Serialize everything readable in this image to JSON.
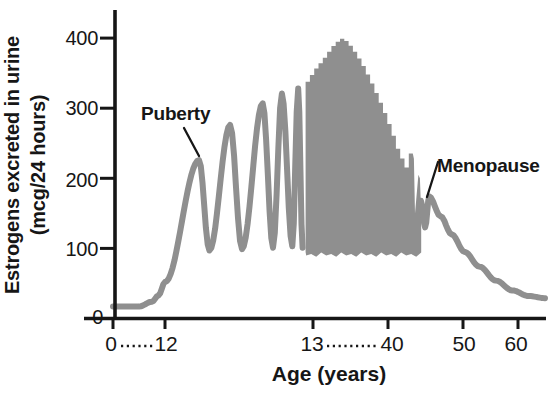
{
  "chart_data": {
    "type": "line",
    "xlabel": "Age (years)",
    "ylabel": "Estrogens excreted in urine (mcg/24 hours)",
    "ylabel_lines": [
      "Estrogens excreted in urine",
      "(mcg/24 hours)"
    ],
    "x_tick_labels": [
      "0",
      "12",
      "13",
      "40",
      "50",
      "60"
    ],
    "x_tick_ages": [
      0,
      12,
      13,
      40,
      50,
      60
    ],
    "x_axis_breaks": [
      {
        "between": [
          "0",
          "12"
        ]
      },
      {
        "between": [
          "13",
          "40"
        ]
      }
    ],
    "y_tick_labels": [
      "0",
      "100",
      "200",
      "300",
      "400"
    ],
    "y_tick_values": [
      0,
      100,
      200,
      300,
      400
    ],
    "ylim": [
      0,
      440
    ],
    "grid": false,
    "annotations": [
      {
        "label": "Puberty",
        "age": 12.25,
        "value": 226
      },
      {
        "label": "Menopause",
        "age": 45.5,
        "value": 174
      }
    ],
    "series": [
      {
        "name": "childhood-baseline-and-first-cycles",
        "style": "line",
        "smooth": "cosine",
        "points": [
          [
            0,
            17
          ],
          [
            6,
            17
          ],
          [
            9,
            24
          ],
          [
            10.5,
            33
          ],
          [
            12.0,
            52
          ],
          [
            12.23,
            226
          ],
          [
            12.3,
            97
          ],
          [
            12.44,
            276
          ],
          [
            12.52,
            99
          ],
          [
            12.66,
            307
          ],
          [
            12.73,
            101
          ],
          [
            12.79,
            321
          ],
          [
            12.86,
            103
          ],
          [
            12.9,
            328
          ],
          [
            12.93,
            101
          ]
        ]
      },
      {
        "name": "reproductive-years-cycle-band",
        "style": "band",
        "bottom_value": 95,
        "age_start": 12.95,
        "age_end": 44.42,
        "top_profile": [
          [
            12.95,
            333
          ],
          [
            13.05,
            350
          ],
          [
            14.8,
            360
          ],
          [
            16.6,
            368
          ],
          [
            18.4,
            378
          ],
          [
            20.2,
            388
          ],
          [
            22.0,
            395
          ],
          [
            23.8,
            400
          ],
          [
            25.6,
            394
          ],
          [
            27.4,
            385
          ],
          [
            29.2,
            374
          ],
          [
            31.0,
            362
          ],
          [
            32.8,
            348
          ],
          [
            34.6,
            333
          ],
          [
            36.4,
            317
          ],
          [
            38.2,
            301
          ],
          [
            40.0,
            283
          ],
          [
            40.7,
            263
          ],
          [
            41.3,
            243
          ],
          [
            42.0,
            226
          ],
          [
            42.5,
            215
          ],
          [
            42.9,
            237
          ],
          [
            43.3,
            232
          ]
        ],
        "tail_profile": [
          [
            43.45,
            228
          ],
          [
            43.6,
            150
          ],
          [
            44.05,
            205
          ],
          [
            44.25,
            200
          ],
          [
            44.42,
            150
          ]
        ]
      },
      {
        "name": "perimenopause-and-postmenopause-decline",
        "style": "line",
        "smooth": "cosine",
        "points": [
          [
            44.38,
            168
          ],
          [
            44.95,
            130
          ],
          [
            45.5,
            174
          ],
          [
            47.0,
            146
          ],
          [
            48.5,
            120
          ],
          [
            50.3,
            95
          ],
          [
            53,
            74
          ],
          [
            56,
            54
          ],
          [
            59,
            40
          ],
          [
            62,
            32
          ],
          [
            65,
            29
          ]
        ]
      }
    ],
    "colors": {
      "curve": "#8f8f8f",
      "axis": "#161616",
      "text": "#161616",
      "background": "#ffffff"
    }
  }
}
